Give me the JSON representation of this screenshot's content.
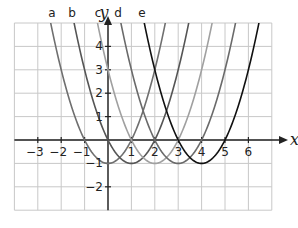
{
  "chart_data": {
    "type": "line",
    "title": "",
    "xlabel": "x",
    "ylabel": "y",
    "xlim": [
      -4,
      7
    ],
    "ylim": [
      -3,
      5
    ],
    "grid": true,
    "x_ticks": [
      -3,
      -2,
      -1,
      1,
      2,
      3,
      4,
      5,
      6
    ],
    "y_ticks": [
      4,
      3,
      2,
      1,
      -1,
      -2
    ],
    "x_tick_labels": [
      "−3",
      "−2",
      "−1",
      "1",
      "2",
      "3",
      "4",
      "5",
      "6"
    ],
    "y_tick_labels": [
      "4",
      "3",
      "2",
      "1",
      "−1",
      "−2"
    ],
    "series": [
      {
        "name": "a",
        "equation": "y = x^2 - 1",
        "vertex": [
          0,
          -1
        ],
        "color": "#6f6f6f"
      },
      {
        "name": "b",
        "equation": "y = (x-1)^2 - 1",
        "vertex": [
          1,
          -1
        ],
        "color": "#555555"
      },
      {
        "name": "c",
        "equation": "y = (x-2)^2 - 1",
        "vertex": [
          2,
          -1
        ],
        "color": "#a0a0a0"
      },
      {
        "name": "d",
        "equation": "y = (x-3)^2 - 1",
        "vertex": [
          3,
          -1
        ],
        "color": "#6a6a6a"
      },
      {
        "name": "e",
        "equation": "y = (x-4)^2 - 1",
        "vertex": [
          4,
          -1
        ],
        "color": "#111111"
      }
    ],
    "curve_labels": [
      "a",
      "b",
      "c",
      "d",
      "e"
    ]
  },
  "axes": {
    "x_label": "x",
    "y_label": "y"
  },
  "colors": {
    "grid": "#c8c8c8",
    "axis": "#222222",
    "background": "#ffffff"
  }
}
